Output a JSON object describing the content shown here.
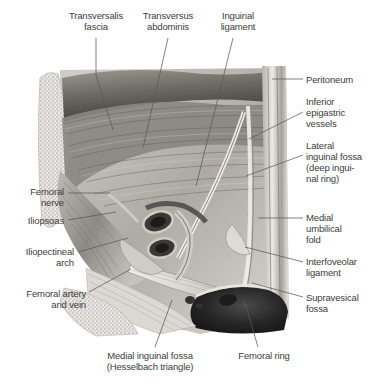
{
  "figure": {
    "view": "right side, viewed from inside the abdomen",
    "style": "grayscale medical illustration"
  },
  "labels": [
    {
      "id": "transversalis-fascia",
      "text": "Transversalis\nfascia",
      "x": 58,
      "y": 10,
      "w": 76,
      "align": "center",
      "leader": [
        [
          96,
          38
        ],
        [
          96,
          75
        ],
        [
          113,
          130
        ]
      ]
    },
    {
      "id": "transversus-abdominis",
      "text": "Transversus\nabdominis",
      "x": 129,
      "y": 10,
      "w": 78,
      "align": "center",
      "leader": [
        [
          168,
          38
        ],
        [
          143,
          148
        ]
      ]
    },
    {
      "id": "inguinal-ligament",
      "text": "Inguinal\nligament",
      "x": 206,
      "y": 10,
      "w": 64,
      "align": "center",
      "leader": [
        [
          233,
          38
        ],
        [
          196,
          186
        ]
      ]
    },
    {
      "id": "peritoneum",
      "text": "Peritoneum",
      "x": 306,
      "y": 74,
      "w": 64,
      "align": "left",
      "leader": [
        [
          303,
          79
        ],
        [
          272,
          79
        ]
      ]
    },
    {
      "id": "inferior-epigastric-vessels",
      "text": "Inferior\nepigastric\nvessels",
      "x": 306,
      "y": 96,
      "w": 64,
      "align": "left",
      "leader": [
        [
          303,
          112
        ],
        [
          249,
          139
        ]
      ]
    },
    {
      "id": "lateral-inguinal-fossa",
      "text": "Lateral\ninguinal fossa\n(deep ingui-\nnal ring)",
      "x": 306,
      "y": 140,
      "w": 66,
      "align": "left",
      "leader": [
        [
          303,
          155
        ],
        [
          246,
          176
        ]
      ]
    },
    {
      "id": "medial-umbilical-fold",
      "text": "Medial\numbilical\nfold",
      "x": 306,
      "y": 212,
      "w": 64,
      "align": "left",
      "leader": [
        [
          303,
          218
        ],
        [
          258,
          218
        ]
      ]
    },
    {
      "id": "interfoveolar-ligament",
      "text": "Interfoveolar\nligament",
      "x": 306,
      "y": 256,
      "w": 66,
      "align": "left",
      "leader": [
        [
          303,
          262
        ],
        [
          245,
          247
        ]
      ]
    },
    {
      "id": "supravesical-fossa",
      "text": "Supravesical\nfossa",
      "x": 306,
      "y": 292,
      "w": 66,
      "align": "left",
      "leader": [
        [
          303,
          297
        ],
        [
          252,
          283
        ]
      ]
    },
    {
      "id": "femoral-nerve",
      "text": "Femoral\nnerve",
      "x": 2,
      "y": 186,
      "w": 62,
      "align": "right",
      "leader": [
        [
          68,
          193
        ],
        [
          110,
          193
        ]
      ]
    },
    {
      "id": "iliopsoas",
      "text": "Iliopsoas",
      "x": 2,
      "y": 215,
      "w": 62,
      "align": "right",
      "leader": [
        [
          68,
          220
        ],
        [
          116,
          212
        ]
      ]
    },
    {
      "id": "iliopectineal-arch",
      "text": "Iliopectineal\narch",
      "x": 2,
      "y": 246,
      "w": 72,
      "align": "right",
      "leader": [
        [
          78,
          252
        ],
        [
          128,
          238
        ]
      ]
    },
    {
      "id": "femoral-artery-and-vein",
      "text": "Femoral artery\nand vein",
      "x": 0,
      "y": 288,
      "w": 86,
      "align": "right",
      "leader": [
        [
          89,
          292
        ],
        [
          131,
          269
        ]
      ]
    },
    {
      "id": "medial-inguinal-fossa",
      "text": "Medial inguinal fossa\n(Hesselbach triangle)",
      "x": 86,
      "y": 350,
      "w": 128,
      "align": "center",
      "leader": [
        [
          155,
          347
        ],
        [
          172,
          300
        ]
      ]
    },
    {
      "id": "femoral-ring",
      "text": "Femoral ring",
      "x": 228,
      "y": 350,
      "w": 72,
      "align": "center",
      "leader": [
        [
          258,
          347
        ],
        [
          244,
          300
        ]
      ]
    }
  ],
  "colors": {
    "label_text": "#3d3d3d",
    "leader_line": "#5a5a5a",
    "background": "#ffffff",
    "tissue_light": "#e8e6e3",
    "tissue_mid": "#b9b5b0",
    "tissue_dark": "#6f6b67",
    "cavity_dark": "#2a2a2a",
    "bone_speckle": "#d8d6d2"
  }
}
